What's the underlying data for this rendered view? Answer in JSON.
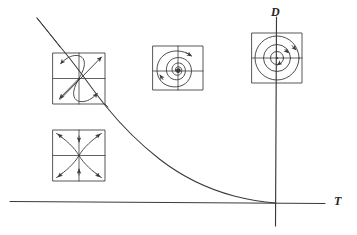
{
  "figure": {
    "width": 357,
    "height": 235,
    "background": "#ffffff",
    "ink_color": "#3a3a3a",
    "line_width": 0.9
  },
  "axes": {
    "horizontal": {
      "name": "trace-axis",
      "label": "T",
      "label_x": 336,
      "label_y": 202,
      "x1": 10,
      "y1": 201.5,
      "x2": 325,
      "y2": 203.5
    },
    "vertical": {
      "name": "determinant-axis",
      "label": "D",
      "label_x": 276,
      "label_y": 13,
      "x1": 276.5,
      "y1": 17,
      "x2": 275.5,
      "y2": 226
    },
    "origin": {
      "x": 276,
      "y": 203
    }
  },
  "discriminant_curve": {
    "name": "discriminant-parabola",
    "description": "Curve T^2 = 4D separating real from complex eigenvalues; tangent to the T axis at the origin",
    "path": "M 37 18 L 58 44 C 70 58 80 72 90 88 C 104 110 120 134 142 155 C 168 180 210 196 246 201 C 258 202.6 268 203 276 203.2",
    "start": {
      "x": 37,
      "y": 18
    },
    "end": {
      "x": 276,
      "y": 203
    }
  },
  "insets": [
    {
      "id": "inset-saddle-node",
      "name": "phase-portrait-improper-node",
      "description": "Degenerate / improper node phase portrait lying on the discriminant parabola",
      "x": 53,
      "y": 53,
      "size": 52
    },
    {
      "id": "inset-saddle",
      "name": "phase-portrait-saddle",
      "description": "Saddle point phase portrait located below the T axis region (D < 0)",
      "x": 53,
      "y": 130,
      "size": 52
    },
    {
      "id": "inset-spiral-sink",
      "name": "phase-portrait-spiral-sink",
      "description": "Stable spiral (spiral sink) phase portrait, complex eigenvalues with negative real part",
      "x": 153,
      "y": 46,
      "size": 50
    },
    {
      "id": "inset-center",
      "name": "phase-portrait-center",
      "description": "Center with closed periodic orbits, located on the D axis",
      "x": 252,
      "y": 33,
      "size": 50
    }
  ]
}
